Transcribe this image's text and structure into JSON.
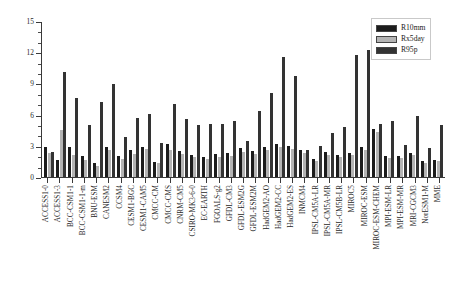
{
  "chart_data": {
    "type": "bar",
    "title": "",
    "xlabel": "",
    "ylabel": "",
    "ylim": [
      0,
      15
    ],
    "ytick_labels": [
      "0",
      "3",
      "6",
      "9",
      "12",
      "15"
    ],
    "ytick_values": [
      0,
      3,
      6,
      9,
      12,
      15
    ],
    "yminor_step": 1,
    "grid": false,
    "legend_position": "top-right",
    "categories": [
      "ACCESS1-0",
      "ACCESS1-3",
      "BCC-CSM1-1",
      "BCC-CSM1-1-m",
      "BNU-ESM",
      "CANESM2",
      "CCSM4",
      "CESM1-BGC",
      "CESM1-CAM5",
      "CMCC-CM",
      "CMCC-CMS",
      "CNRM-CM5",
      "CSIRO-MK3-6-0",
      "EC-EARTH",
      "FGOALS-g2",
      "GFDL-CM3",
      "GFDL-ESM2G",
      "GFDL-ESM2M",
      "HadGEM2-AO",
      "HadGEM2-CC",
      "HadGEM2-ES",
      "INMCM4",
      "IPSL-CM5A-LR",
      "IPSL-CM5A-MR",
      "IPSL-CM5B-LR",
      "MIROC5",
      "MIROC-ESM",
      "MIROC-ESM-CHEM",
      "MPI-ESM-LR",
      "MPI-ESM-MR",
      "MRI-CGCM3",
      "NorESM1-M",
      "MME"
    ],
    "series": [
      {
        "name": "R10mm",
        "color": "#1c1c1c",
        "values": [
          2.9,
          1.6,
          2.9,
          2.0,
          1.3,
          2.9,
          2.0,
          2.6,
          2.9,
          1.4,
          3.2,
          2.5,
          2.1,
          1.9,
          2.2,
          2.3,
          2.8,
          2.5,
          2.9,
          3.2,
          3.0,
          2.6,
          1.7,
          2.4,
          2.1,
          2.3,
          2.9,
          4.6,
          2.0,
          2.0,
          2.3,
          1.5,
          1.6
        ]
      },
      {
        "name": "Rx5day",
        "color": "#b4b4b4",
        "values": [
          2.3,
          4.5,
          2.1,
          1.6,
          1.1,
          2.6,
          1.7,
          2.2,
          2.7,
          1.3,
          2.6,
          2.2,
          1.9,
          1.7,
          1.9,
          2.0,
          2.4,
          2.2,
          2.6,
          2.9,
          2.7,
          2.3,
          1.5,
          2.1,
          1.9,
          2.1,
          2.6,
          4.3,
          1.8,
          1.8,
          2.1,
          1.3,
          1.5
        ]
      },
      {
        "name": "R95p",
        "color": "#333333",
        "values": [
          2.4,
          10.1,
          7.6,
          5.0,
          7.2,
          8.9,
          3.8,
          5.7,
          6.1,
          3.3,
          7.0,
          5.6,
          5.0,
          5.1,
          5.1,
          5.4,
          3.5,
          6.3,
          8.1,
          11.5,
          9.7,
          2.6,
          3.0,
          4.2,
          4.8,
          11.7,
          12.2,
          5.1,
          5.4,
          3.1,
          5.9,
          2.8,
          5.0
        ]
      }
    ]
  },
  "legend": {
    "items": [
      {
        "label": "R10mm"
      },
      {
        "label": "Rx5day"
      },
      {
        "label": "R95p"
      }
    ]
  }
}
